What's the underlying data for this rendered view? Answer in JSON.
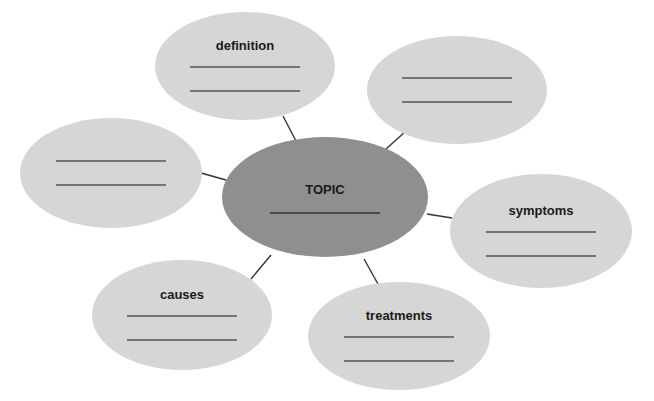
{
  "diagram": {
    "type": "concept-map",
    "colors": {
      "background": "#ffffff",
      "outer_fill": "#d6d6d6",
      "center_fill": "#8f8f8f",
      "connector": "#333333",
      "blank_line": "#555555",
      "label": "#1a1a1a"
    },
    "center": {
      "label": "TOPIC",
      "cx": 325,
      "cy": 197,
      "rx": 103,
      "ry": 60,
      "blank_lines": 1
    },
    "nodes": [
      {
        "id": "definition",
        "label": "definition",
        "cx": 245,
        "cy": 66,
        "rx": 90,
        "ry": 54,
        "blank_lines": 2
      },
      {
        "id": "top-right",
        "label": "",
        "cx": 457,
        "cy": 90,
        "rx": 90,
        "ry": 54,
        "blank_lines": 2
      },
      {
        "id": "left",
        "label": "",
        "cx": 111,
        "cy": 173,
        "rx": 91,
        "ry": 55,
        "blank_lines": 2
      },
      {
        "id": "symptoms",
        "label": "symptoms",
        "cx": 541,
        "cy": 231,
        "rx": 91,
        "ry": 57,
        "blank_lines": 2
      },
      {
        "id": "causes",
        "label": "causes",
        "cx": 182,
        "cy": 315,
        "rx": 90,
        "ry": 55,
        "blank_lines": 2
      },
      {
        "id": "treatments",
        "label": "treatments",
        "cx": 399,
        "cy": 336,
        "rx": 91,
        "ry": 54,
        "blank_lines": 2
      }
    ],
    "connectors": [
      {
        "from": "definition",
        "x1": 283,
        "y1": 116,
        "x2": 296,
        "y2": 141
      },
      {
        "from": "top-right",
        "x1": 406,
        "y1": 131,
        "x2": 386,
        "y2": 149
      },
      {
        "from": "left",
        "x1": 201,
        "y1": 173,
        "x2": 226,
        "y2": 180
      },
      {
        "from": "symptoms",
        "x1": 427,
        "y1": 214,
        "x2": 452,
        "y2": 218
      },
      {
        "from": "causes",
        "x1": 251,
        "y1": 279,
        "x2": 271,
        "y2": 255
      },
      {
        "from": "treatments",
        "x1": 364,
        "y1": 259,
        "x2": 378,
        "y2": 284
      }
    ]
  }
}
